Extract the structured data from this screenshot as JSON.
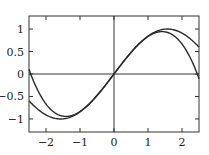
{
  "chart_data": {
    "type": "line",
    "title": "",
    "xlabel": "",
    "ylabel": "",
    "xlim": [
      -2.5,
      2.5
    ],
    "ylim": [
      -1.29,
      1.29
    ],
    "grid": false,
    "legend": null,
    "zero_lines": true,
    "x_ticks": [
      -2,
      -1,
      0,
      1,
      2
    ],
    "x_tick_labels": [
      "−2",
      "−1",
      "0",
      "1",
      "2"
    ],
    "y_ticks": [
      1,
      0.5,
      0,
      -0.5,
      -1
    ],
    "y_tick_labels": [
      "1",
      "0.5",
      "0",
      "−0.5",
      "−1"
    ],
    "x": [
      -2.5,
      -2.25,
      -2.0,
      -1.75,
      -1.5,
      -1.25,
      -1.0,
      -0.75,
      -0.5,
      -0.25,
      0.0,
      0.25,
      0.5,
      0.75,
      1.0,
      1.25,
      1.5,
      1.75,
      2.0,
      2.25,
      2.5
    ],
    "series": [
      {
        "name": "sin(x)",
        "color": "#2a2a2a",
        "values": [
          -0.598,
          -0.778,
          -0.909,
          -0.984,
          -0.997,
          -0.949,
          -0.841,
          -0.682,
          -0.479,
          -0.247,
          0.0,
          0.247,
          0.479,
          0.682,
          0.841,
          0.949,
          0.997,
          0.984,
          0.909,
          0.778,
          0.598
        ]
      },
      {
        "name": "x - x^3/6",
        "color": "#2a2a2a",
        "values": [
          0.104,
          -0.352,
          -0.667,
          -0.857,
          -0.938,
          -0.924,
          -0.833,
          -0.68,
          -0.479,
          -0.247,
          0.0,
          0.247,
          0.479,
          0.68,
          0.833,
          0.924,
          0.938,
          0.857,
          0.667,
          0.352,
          -0.104
        ]
      }
    ]
  },
  "plot_area": {
    "left": 29,
    "top": 16,
    "right": 199,
    "bottom": 132
  }
}
